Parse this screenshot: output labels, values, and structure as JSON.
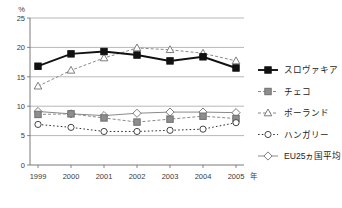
{
  "chart_data": {
    "type": "line",
    "title": "",
    "xlabel": "",
    "ylabel": "",
    "unit": "%",
    "x_suffix": "年",
    "categories": [
      "1999",
      "2000",
      "2001",
      "2002",
      "2003",
      "2004",
      "2005"
    ],
    "ylim": [
      0,
      25
    ],
    "yticks": [
      0,
      5,
      10,
      15,
      20,
      25
    ],
    "grid": true,
    "legend_position": "right",
    "series": [
      {
        "name": "スロヴァキア",
        "marker": "filled-square",
        "color": "#111111",
        "linestyle": "solid",
        "values": [
          16.8,
          18.9,
          19.3,
          18.7,
          17.7,
          18.4,
          16.5
        ]
      },
      {
        "name": "チェコ",
        "marker": "filled-square-gray",
        "color": "#8a8a8a",
        "linestyle": "dashed",
        "values": [
          8.6,
          8.7,
          8.0,
          7.3,
          7.8,
          8.3,
          7.9
        ]
      },
      {
        "name": "ポーランド",
        "marker": "open-triangle",
        "color": "#8a8a8a",
        "linestyle": "dashed",
        "values": [
          13.4,
          16.1,
          18.2,
          19.9,
          19.6,
          19.0,
          17.7
        ]
      },
      {
        "name": "ハンガリー",
        "marker": "open-circle",
        "color": "#333333",
        "linestyle": "dotted",
        "values": [
          6.9,
          6.4,
          5.7,
          5.7,
          5.9,
          6.1,
          7.2
        ]
      },
      {
        "name": "EU25ヵ国平均",
        "marker": "open-diamond",
        "color": "#8a8a8a",
        "linestyle": "solid",
        "values": [
          9.1,
          8.7,
          8.4,
          8.8,
          9.0,
          9.0,
          8.9
        ]
      }
    ]
  },
  "axis": {
    "y_unit": "%",
    "y_ticks": [
      "25",
      "20",
      "15",
      "10",
      "5",
      "0"
    ],
    "x_ticks": [
      "1999",
      "2000",
      "2001",
      "2002",
      "2003",
      "2004",
      "2005"
    ],
    "x_last_suffix": "年"
  },
  "legend": {
    "items": [
      {
        "label": "スロヴァキア",
        "icon": "filled-square-marker-icon"
      },
      {
        "label": "チェコ",
        "icon": "filled-gray-square-marker-icon"
      },
      {
        "label": "ポーランド",
        "icon": "open-triangle-marker-icon"
      },
      {
        "label": "ハンガリー",
        "icon": "open-circle-marker-icon"
      },
      {
        "label": "EU25ヵ国平均",
        "icon": "open-diamond-marker-icon"
      }
    ]
  }
}
